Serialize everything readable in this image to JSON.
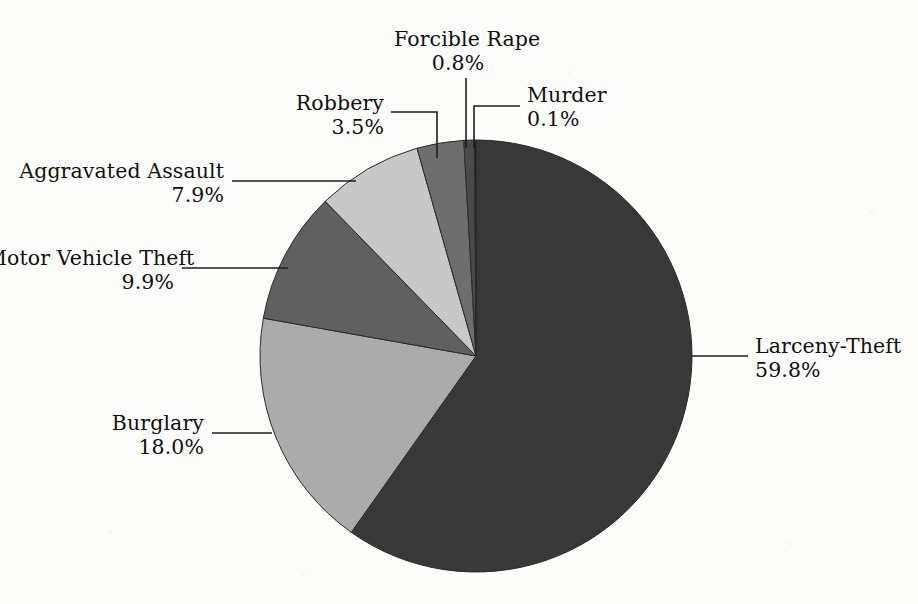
{
  "chart_data": {
    "type": "pie",
    "title": "",
    "subtitle": "",
    "xlabel": "",
    "ylabel": "",
    "legend_position": "none",
    "grid": false,
    "units": "percent",
    "start_angle_deg": 0,
    "direction": "clockwise",
    "categories": [
      "Larceny-Theft",
      "Burglary",
      "Motor Vehicle Theft",
      "Aggravated Assault",
      "Robbery",
      "Forcible Rape",
      "Murder"
    ],
    "values": [
      59.8,
      18.0,
      9.9,
      7.9,
      3.5,
      0.8,
      0.1
    ],
    "value_labels": [
      "59.8%",
      "18.0%",
      "9.9%",
      "7.9%",
      "3.5%",
      "0.8%",
      "0.1%"
    ],
    "colors": [
      "#383838",
      "#ababab",
      "#606060",
      "#c8c8c8",
      "#6e6e6e",
      "#4a4a4a",
      "#151515"
    ],
    "slices": [
      {
        "name": "Larceny-Theft",
        "value": 59.8,
        "value_label": "59.8%",
        "color": "#383838"
      },
      {
        "name": "Burglary",
        "value": 18.0,
        "value_label": "18.0%",
        "color": "#ababab"
      },
      {
        "name": "Motor Vehicle Theft",
        "value": 9.9,
        "value_label": "9.9%",
        "color": "#606060"
      },
      {
        "name": "Aggravated Assault",
        "value": 7.9,
        "value_label": "7.9%",
        "color": "#c8c8c8"
      },
      {
        "name": "Robbery",
        "value": 3.5,
        "value_label": "3.5%",
        "color": "#6e6e6e"
      },
      {
        "name": "Forcible Rape",
        "value": 0.8,
        "value_label": "0.8%",
        "color": "#4a4a4a"
      },
      {
        "name": "Murder",
        "value": 0.1,
        "value_label": "0.1%",
        "color": "#151515"
      }
    ]
  },
  "labels": {
    "forcible_rape": {
      "name": "Forcible Rape",
      "pct": "0.8%"
    },
    "murder": {
      "name": "Murder",
      "pct": "0.1%"
    },
    "robbery": {
      "name": "Robbery",
      "pct": "3.5%"
    },
    "aggravated_assault": {
      "name": "Aggravated Assault",
      "pct": "7.9%"
    },
    "motor_vehicle_theft": {
      "name": "Motor Vehicle Theft",
      "pct": "9.9%"
    },
    "burglary": {
      "name": "Burglary",
      "pct": "18.0%"
    },
    "larceny_theft": {
      "name": "Larceny-Theft",
      "pct": "59.8%"
    }
  },
  "style": {
    "background": "#fdfdfb",
    "text_color": "#101010",
    "leader_color": "#1e1e1e",
    "slice_outline": "#2a2a2a"
  },
  "geometry": {
    "center_x": 476,
    "center_y": 356,
    "radius": 216
  }
}
